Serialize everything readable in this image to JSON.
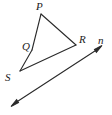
{
  "figure": {
    "type": "geometry-diagram",
    "width": 112,
    "height": 115,
    "background_color": "#ffffff",
    "stroke_color": "#2a2a2a",
    "label_color": "#1b1b1b",
    "stroke_width": 1.1
  },
  "labels": [
    {
      "id": "P",
      "text": "P",
      "x": 36,
      "y": 1
    },
    {
      "id": "Q",
      "text": "Q",
      "x": 22,
      "y": 41
    },
    {
      "id": "R",
      "text": "R",
      "x": 79,
      "y": 34
    },
    {
      "id": "n",
      "text": "n",
      "x": 98,
      "y": 35
    },
    {
      "id": "S",
      "text": "S",
      "x": 5,
      "y": 72
    }
  ],
  "points": {
    "P": {
      "x": 41,
      "y": 14
    },
    "Q": {
      "x": 32,
      "y": 50
    },
    "R": {
      "x": 76,
      "y": 45
    },
    "S": {
      "x": 20,
      "y": 71
    }
  },
  "segments": [
    {
      "name": "PQ",
      "from": "P",
      "to": "Q"
    },
    {
      "name": "QS",
      "from": "Q",
      "to": "S"
    },
    {
      "name": "SR",
      "from": "S",
      "to": "R"
    },
    {
      "name": "RP",
      "from": "R",
      "to": "P"
    }
  ],
  "line_n": {
    "name": "n",
    "double_headed": true,
    "start": {
      "x": 12,
      "y": 105
    },
    "end": {
      "x": 101,
      "y": 47
    }
  }
}
